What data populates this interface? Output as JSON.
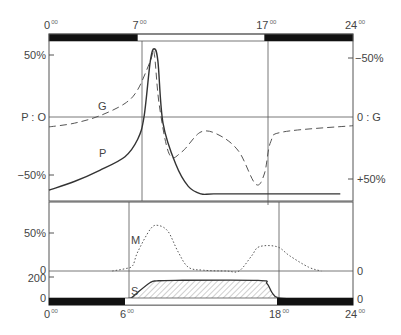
{
  "top_axis": {
    "hour_labels": [
      {
        "hour": 0,
        "text": "0",
        "sup": "00"
      },
      {
        "hour": 7,
        "text": "7",
        "sup": "00"
      },
      {
        "hour": 17,
        "text": "17",
        "sup": "00"
      },
      {
        "hour": 24,
        "text": "24",
        "sup": "00"
      }
    ],
    "dark_periods": [
      [
        0,
        7
      ],
      [
        17,
        24
      ]
    ]
  },
  "bottom_axis": {
    "hour_labels": [
      {
        "hour": 0,
        "text": "0",
        "sup": "00"
      },
      {
        "hour": 6,
        "text": "6",
        "sup": "00"
      },
      {
        "hour": 18,
        "text": "18",
        "sup": "00"
      },
      {
        "hour": 24,
        "text": "24",
        "sup": "00"
      }
    ],
    "dark_periods": [
      [
        0,
        6
      ],
      [
        18,
        24
      ]
    ]
  },
  "upper_panel": {
    "left_labels": {
      "top": "50%",
      "zero": "P : O",
      "bottom": "−50%"
    },
    "right_labels": {
      "top": "−50%",
      "zero": "0 : G",
      "bottom": "+50%"
    },
    "curve_labels": {
      "G": "G",
      "P": "P"
    }
  },
  "lower_panel": {
    "left_labels": {
      "m_50": "50%",
      "m_zero": "0",
      "s_200": "200",
      "s_zero": "0"
    },
    "right_labels": {
      "m_zero": "0",
      "s_zero": "0"
    },
    "curve_labels": {
      "M": "M",
      "S": "S"
    }
  },
  "chart_data": {
    "type": "line",
    "title": "",
    "xlabel": "hour of day",
    "xlim": [
      0,
      24
    ],
    "series": [
      {
        "name": "P",
        "style": "solid",
        "axis": "left (percent, 0 at P:O line)",
        "x": [
          0,
          2,
          4,
          6,
          7,
          7.5,
          8,
          8.3,
          8.6,
          9,
          10,
          11,
          12,
          13,
          16,
          19,
          23
        ],
        "y": [
          -59,
          -52,
          -43,
          -32,
          -18,
          0,
          45,
          55,
          45,
          -5,
          -38,
          -56,
          -62,
          -62,
          -62,
          -62,
          -62
        ]
      },
      {
        "name": "G",
        "style": "dashed",
        "axis": "right (inverted percent, 0 at 0:G line)",
        "x": [
          0,
          2,
          4,
          6,
          7,
          8,
          8.3,
          8.7,
          9.5,
          10.5,
          12,
          13.5,
          15,
          16.3,
          17,
          17.5,
          18.5,
          24
        ],
        "y": [
          8,
          5,
          -1,
          -11,
          -22,
          -45,
          -52,
          -10,
          30,
          28,
          12,
          15,
          28,
          54,
          46,
          20,
          12,
          7
        ]
      },
      {
        "name": "M",
        "style": "dotted",
        "axis": "percent above 0 line",
        "x": [
          5,
          6,
          6.6,
          7,
          8,
          8.6,
          9.4,
          10.2,
          11,
          12.2,
          14,
          15,
          16,
          16.6,
          18,
          19,
          20.5,
          21.5
        ],
        "y": [
          0,
          3,
          7,
          25,
          55,
          60,
          52,
          25,
          5,
          1,
          0,
          0,
          20,
          32,
          32,
          20,
          5,
          0
        ]
      },
      {
        "name": "S",
        "style": "solid-hatched",
        "axis": "0-200 scale",
        "x": [
          6,
          6.5,
          7,
          8,
          8.5,
          10,
          16.5,
          17.2,
          17.6,
          18,
          19
        ],
        "y": [
          0,
          10,
          60,
          150,
          165,
          170,
          170,
          140,
          60,
          15,
          0
        ]
      }
    ],
    "grid": false,
    "legend": "inline labels"
  }
}
